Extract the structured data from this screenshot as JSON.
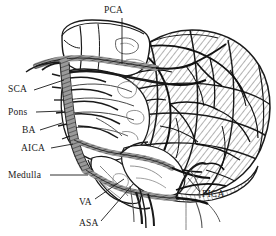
{
  "figure": {
    "background_color": "#ffffff",
    "ink_color": "#1a1a1a",
    "vessel_fill": "#8a8a8a",
    "width": 276,
    "height": 236
  },
  "labels": [
    {
      "id": "pca",
      "text": "PCA",
      "x": 104,
      "y": 6,
      "anchor": "start",
      "leader": {
        "x1": 122,
        "y1": 18,
        "x2": 122,
        "y2": 64
      }
    },
    {
      "id": "sca",
      "text": "SCA",
      "x": 8,
      "y": 85,
      "anchor": "start",
      "leader": {
        "x1": 34,
        "y1": 90,
        "x2": 64,
        "y2": 80
      }
    },
    {
      "id": "pons",
      "text": "Pons",
      "x": 8,
      "y": 108,
      "anchor": "start",
      "leader": {
        "x1": 36,
        "y1": 112,
        "x2": 63,
        "y2": 111
      }
    },
    {
      "id": "ba",
      "text": "BA",
      "x": 22,
      "y": 126,
      "anchor": "start",
      "leader": {
        "x1": 40,
        "y1": 130,
        "x2": 62,
        "y2": 123
      }
    },
    {
      "id": "aica",
      "text": "AICA",
      "x": 21,
      "y": 144,
      "anchor": "start",
      "leader": {
        "x1": 51,
        "y1": 148,
        "x2": 73,
        "y2": 144
      }
    },
    {
      "id": "medulla",
      "text": "Medulla",
      "x": 8,
      "y": 171,
      "anchor": "start",
      "leader": {
        "x1": 50,
        "y1": 175,
        "x2": 88,
        "y2": 175
      }
    },
    {
      "id": "va",
      "text": "VA",
      "x": 79,
      "y": 198,
      "anchor": "start",
      "leader": {
        "x1": 95,
        "y1": 199,
        "x2": 124,
        "y2": 179
      }
    },
    {
      "id": "asa",
      "text": "ASA",
      "x": 79,
      "y": 219,
      "anchor": "start",
      "leader": {
        "x1": 101,
        "y1": 221,
        "x2": 134,
        "y2": 183
      }
    },
    {
      "id": "pica",
      "text": "PICA",
      "x": 202,
      "y": 190,
      "anchor": "start",
      "leader": {
        "x1": 200,
        "y1": 192,
        "x2": 188,
        "y2": 178
      }
    }
  ],
  "structures": [
    {
      "id": "midbrain",
      "name": "Midbrain / cerebral peduncle"
    },
    {
      "id": "pons",
      "name": "Pons"
    },
    {
      "id": "medulla",
      "name": "Medulla oblongata"
    },
    {
      "id": "cerebellum",
      "name": "Cerebellar hemisphere with folia"
    }
  ],
  "arteries": [
    {
      "abbr": "PCA",
      "name": "Posterior cerebral artery"
    },
    {
      "abbr": "SCA",
      "name": "Superior cerebellar artery"
    },
    {
      "abbr": "BA",
      "name": "Basilar artery"
    },
    {
      "abbr": "AICA",
      "name": "Anterior inferior cerebellar artery"
    },
    {
      "abbr": "VA",
      "name": "Vertebral artery"
    },
    {
      "abbr": "ASA",
      "name": "Anterior spinal artery"
    },
    {
      "abbr": "PICA",
      "name": "Posterior inferior cerebellar artery"
    }
  ]
}
